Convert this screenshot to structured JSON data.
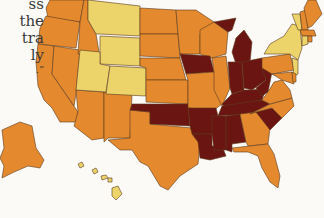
{
  "page": {
    "text_fragment": [
      "ss",
      "the",
      "tra",
      "ly",
      ".”"
    ]
  },
  "map": {
    "type": "choropleth",
    "region": "United States",
    "color_classes": [
      {
        "id": "low",
        "color": "#ecd36a"
      },
      {
        "id": "mid",
        "color": "#e5892f"
      },
      {
        "id": "high",
        "color": "#6b1512"
      }
    ],
    "states": {
      "low": [
        "Montana",
        "Wyoming",
        "Utah",
        "Colorado",
        "New York",
        "Vermont",
        "Connecticut",
        "New Jersey",
        "Hawaii"
      ],
      "mid": [
        "Washington",
        "Oregon",
        "California",
        "Nevada",
        "Idaho",
        "Arizona",
        "New Mexico",
        "Texas",
        "North Dakota",
        "South Dakota",
        "Nebraska",
        "Kansas",
        "Minnesota",
        "Wisconsin",
        "Missouri",
        "Illinois",
        "Pennsylvania",
        "Maryland",
        "Virginia",
        "North Carolina",
        "Georgia",
        "Florida",
        "Maine",
        "New Hampshire",
        "Massachusetts",
        "Rhode Island",
        "Delaware",
        "Alaska"
      ],
      "high": [
        "Iowa",
        "Michigan",
        "Indiana",
        "Ohio",
        "Kentucky",
        "Tennessee",
        "West Virginia",
        "Oklahoma",
        "Arkansas",
        "Louisiana",
        "Mississippi",
        "Alabama",
        "South Carolina"
      ]
    }
  }
}
